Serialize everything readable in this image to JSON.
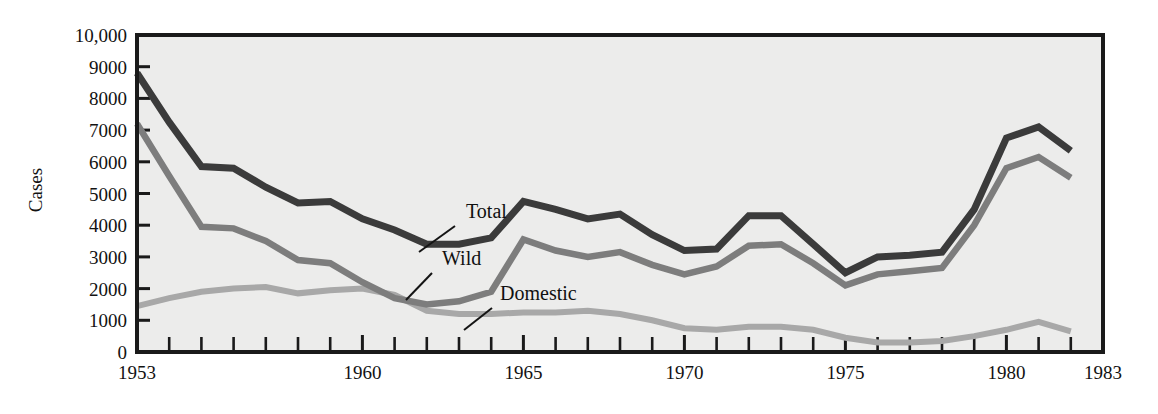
{
  "chart_data": {
    "type": "line",
    "title": "",
    "xlabel": "",
    "ylabel": "Cases",
    "x": [
      1953,
      1954,
      1955,
      1956,
      1957,
      1958,
      1959,
      1960,
      1961,
      1962,
      1963,
      1964,
      1965,
      1966,
      1967,
      1968,
      1969,
      1970,
      1971,
      1972,
      1973,
      1974,
      1975,
      1976,
      1977,
      1978,
      1979,
      1980,
      1981,
      1982
    ],
    "xlim": [
      1953,
      1983
    ],
    "ylim": [
      0,
      10000
    ],
    "grid": false,
    "legend_position": "inline-annotations",
    "xtick_labels": [
      "1953",
      "1960",
      "1965",
      "1970",
      "1975",
      "1980",
      "1983"
    ],
    "xtick_values": [
      1953,
      1960,
      1965,
      1970,
      1975,
      1980,
      1983
    ],
    "ytick_labels": [
      "0",
      "1000",
      "2000",
      "3000",
      "4000",
      "5000",
      "6000",
      "7000",
      "8000",
      "9000",
      "10,000"
    ],
    "ytick_values": [
      0,
      1000,
      2000,
      3000,
      4000,
      5000,
      6000,
      7000,
      8000,
      9000,
      10000
    ],
    "series": [
      {
        "name": "Total",
        "color": "#3b3b3b",
        "label_text": "Total",
        "values": [
          8800,
          7250,
          5850,
          5800,
          5200,
          4700,
          4750,
          4200,
          3850,
          3400,
          3400,
          3600,
          4750,
          4500,
          4200,
          4350,
          3700,
          3200,
          3250,
          4300,
          4300,
          3400,
          2500,
          3000,
          3050,
          3150,
          4500,
          6750,
          7100,
          6350
        ]
      },
      {
        "name": "Wild",
        "color": "#7d7d7d",
        "label_text": "Wild",
        "values": [
          7200,
          5550,
          3950,
          3900,
          3500,
          2900,
          2800,
          2200,
          1700,
          1500,
          1600,
          1900,
          3550,
          3200,
          3000,
          3150,
          2750,
          2450,
          2700,
          3350,
          3400,
          2800,
          2100,
          2450,
          2550,
          2650,
          4000,
          5800,
          6150,
          5500
        ]
      },
      {
        "name": "Domestic",
        "color": "#a8a8a8",
        "label_text": "Domestic",
        "values": [
          1450,
          1700,
          1900,
          2000,
          2050,
          1850,
          1950,
          2000,
          1800,
          1300,
          1200,
          1200,
          1250,
          1250,
          1300,
          1200,
          1000,
          750,
          700,
          800,
          800,
          700,
          450,
          300,
          300,
          350,
          500,
          700,
          950,
          650
        ]
      }
    ],
    "annotations": [
      {
        "text": "Total",
        "series": "Total",
        "x": 1963.5,
        "label_x": 466,
        "label_y": 218,
        "leader_from_x": 455,
        "leader_from_y": 226,
        "leader_to_x": 419,
        "leader_to_y": 252
      },
      {
        "text": "Wild",
        "series": "Wild",
        "x": 1962.5,
        "label_x": 442,
        "label_y": 265,
        "leader_from_x": 432,
        "leader_from_y": 273,
        "leader_to_x": 406,
        "leader_to_y": 300
      },
      {
        "text": "Domestic",
        "series": "Domestic",
        "x": 1965,
        "label_x": 500,
        "label_y": 300,
        "leader_from_x": 492,
        "leader_from_y": 308,
        "leader_to_x": 464,
        "leader_to_y": 330
      }
    ]
  },
  "plot": {
    "left_px": 137,
    "right_px": 1103,
    "top_px": 35,
    "bottom_px": 352
  }
}
